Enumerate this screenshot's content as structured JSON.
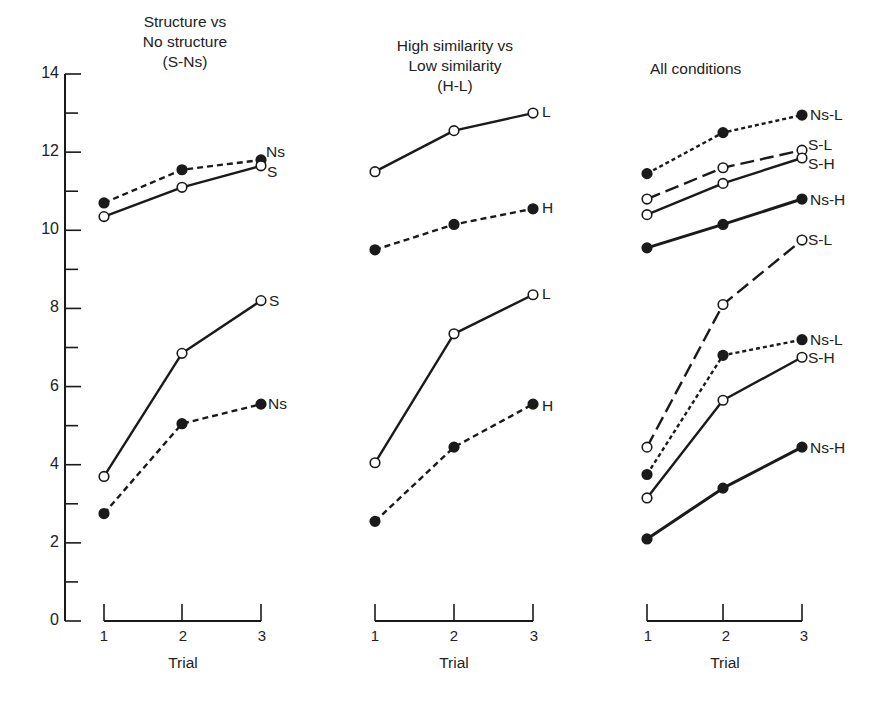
{
  "chart_data": {
    "type": "line",
    "y_axis": {
      "label": "",
      "ylim": [
        0,
        14
      ],
      "major_ticks": [
        0,
        2,
        4,
        6,
        8,
        10,
        12,
        14
      ],
      "minor_ticks": [
        1,
        3,
        5,
        7,
        9,
        11,
        13
      ],
      "tick_labels": [
        "0",
        "2",
        "4",
        "6",
        "8",
        "10",
        "12",
        "14"
      ]
    },
    "grid": false,
    "legend": "inline labels at right end of each line",
    "panels": [
      {
        "title": "Structure vs\nNo structure\n(S-Ns)",
        "xlabel": "Trial",
        "categories": [
          "1",
          "2",
          "3"
        ],
        "series": [
          {
            "name": "Ns",
            "group": "upper",
            "marker": "filled",
            "line": "dashed",
            "values": [
              10.7,
              11.55,
              11.8
            ]
          },
          {
            "name": "S",
            "group": "upper",
            "marker": "open",
            "line": "solid",
            "values": [
              10.35,
              11.1,
              11.65
            ]
          },
          {
            "name": "S",
            "group": "lower",
            "marker": "open",
            "line": "solid",
            "values": [
              3.7,
              6.85,
              8.2
            ]
          },
          {
            "name": "Ns",
            "group": "lower",
            "marker": "filled",
            "line": "dashed",
            "values": [
              2.75,
              5.05,
              5.55
            ]
          }
        ]
      },
      {
        "title": "High similarity vs\nLow similarity\n(H-L)",
        "xlabel": "Trial",
        "categories": [
          "1",
          "2",
          "3"
        ],
        "series": [
          {
            "name": "L",
            "group": "upper",
            "marker": "open",
            "line": "solid",
            "values": [
              11.5,
              12.55,
              13.0
            ]
          },
          {
            "name": "H",
            "group": "upper",
            "marker": "filled",
            "line": "dashed",
            "values": [
              9.5,
              10.15,
              10.55
            ]
          },
          {
            "name": "L",
            "group": "lower",
            "marker": "open",
            "line": "solid",
            "values": [
              4.05,
              7.35,
              8.35
            ]
          },
          {
            "name": "H",
            "group": "lower",
            "marker": "filled",
            "line": "dashed",
            "values": [
              2.55,
              4.45,
              5.55
            ]
          }
        ]
      },
      {
        "title": "All conditions",
        "xlabel": "Trial",
        "categories": [
          "1",
          "2",
          "3"
        ],
        "series": [
          {
            "name": "Ns-L",
            "group": "upper",
            "marker": "filled",
            "line": "dotted",
            "values": [
              11.45,
              12.5,
              12.95
            ]
          },
          {
            "name": "S-L",
            "group": "upper",
            "marker": "open",
            "line": "longdash",
            "values": [
              10.8,
              11.6,
              12.05
            ]
          },
          {
            "name": "S-H",
            "group": "upper",
            "marker": "open",
            "line": "solid",
            "values": [
              10.4,
              11.2,
              11.85
            ]
          },
          {
            "name": "Ns-H",
            "group": "upper",
            "marker": "filled",
            "line": "solid",
            "values": [
              9.55,
              10.15,
              10.8
            ]
          },
          {
            "name": "S-L",
            "group": "lower",
            "marker": "open",
            "line": "longdash",
            "values": [
              4.45,
              8.1,
              9.75
            ]
          },
          {
            "name": "Ns-L",
            "group": "lower",
            "marker": "filled",
            "line": "dotted",
            "values": [
              3.75,
              6.8,
              7.2
            ]
          },
          {
            "name": "S-H",
            "group": "lower",
            "marker": "open",
            "line": "solid",
            "values": [
              3.15,
              5.65,
              6.75
            ]
          },
          {
            "name": "Ns-H",
            "group": "lower",
            "marker": "filled",
            "line": "solid",
            "values": [
              2.1,
              3.4,
              4.45
            ]
          }
        ]
      }
    ]
  },
  "colors": {
    "ink": "#1a1a1a",
    "background": "#ffffff"
  }
}
